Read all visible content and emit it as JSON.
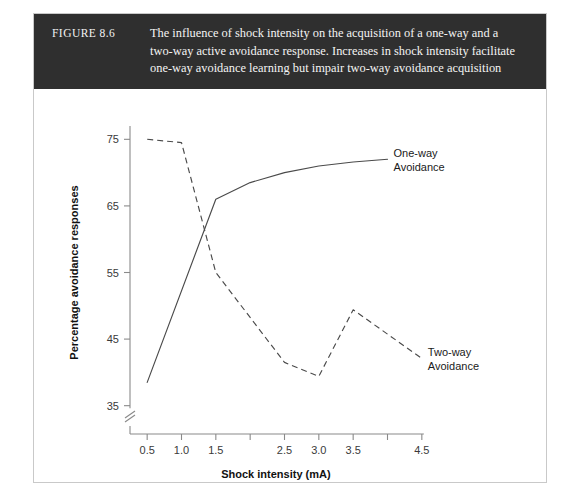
{
  "figure": {
    "number_label": "FIGURE 8.6",
    "caption": "The influence of shock intensity on the acquisition of a one-way and a two-way active avoidance response. Increases in shock intensity facilitate one-way avoidance learning but impair two-way avoidance acquisition",
    "header_bg": "#2f2f2f",
    "border_color": "#c9c9c9"
  },
  "chart_data": {
    "type": "line",
    "title": "",
    "xlabel": "Shock intensity (mA)",
    "ylabel": "Percentage avoidance responses",
    "xlim": [
      0.25,
      4.75
    ],
    "ylim": [
      33,
      77
    ],
    "xticks": [
      0.5,
      1.0,
      1.5,
      2.0,
      2.5,
      3.0,
      3.5,
      4.0,
      4.5
    ],
    "xticklabels": [
      "0.5",
      "1.0",
      "1.5",
      "",
      "2.5",
      "3.0",
      "3.5",
      "",
      "4.5"
    ],
    "yticks": [
      35,
      45,
      55,
      65,
      75
    ],
    "yticklabels": [
      "35",
      "45",
      "55",
      "65",
      "75"
    ],
    "y_axis_break": true,
    "grid": false,
    "legend_position": "inline-at-line-end",
    "series": [
      {
        "name": "One-way Avoidance",
        "label_line1": "One-way",
        "label_line2": "Avoidance",
        "style": "solid",
        "color": "#4a4a4a",
        "x": [
          0.5,
          1.5,
          2.0,
          2.5,
          3.0,
          3.5,
          4.0
        ],
        "values": [
          38.5,
          66.0,
          68.5,
          70.0,
          71.0,
          71.6,
          72.0
        ]
      },
      {
        "name": "Two-way Avoidance",
        "label_line1": "Two-way",
        "label_line2": "Avoidance",
        "style": "dashed",
        "color": "#4a4a4a",
        "x": [
          0.5,
          1.0,
          1.5,
          2.5,
          3.0,
          3.5,
          4.5
        ],
        "values": [
          75.0,
          74.5,
          55.0,
          41.5,
          39.4,
          49.4,
          42.1
        ]
      }
    ]
  }
}
